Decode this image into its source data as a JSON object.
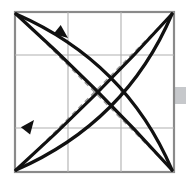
{
  "figure": {
    "canvas": {
      "width": 186,
      "height": 183,
      "background": "#ffffff"
    },
    "frame": {
      "name": "square-paper-border",
      "x": 15,
      "y": 12,
      "width": 159,
      "height": 160,
      "stroke": "#8a8a8a",
      "stroke_width": 2.2,
      "fill": "#ffffff"
    },
    "grid": {
      "name": "thirds-grid",
      "stroke": "#b0b0b0",
      "stroke_width": 1.1,
      "vertical_x": [
        68,
        121
      ],
      "horizontal_y": [
        55,
        128
      ]
    },
    "diagonals": [
      {
        "name": "dashed-diagonal-tl-br",
        "x1": 15,
        "y1": 12,
        "x2": 174,
        "y2": 172,
        "stroke": "#9a9a9a",
        "stroke_width": 1.4,
        "dash": "5 4"
      },
      {
        "name": "dashed-diagonal-bl-tr",
        "x1": 15,
        "y1": 172,
        "x2": 174,
        "y2": 12,
        "stroke": "#9a9a9a",
        "stroke_width": 1.4,
        "dash": "5 4"
      }
    ],
    "curves": [
      {
        "name": "bold-arc-tl-to-br-outer",
        "from": [
          16,
          14
        ],
        "control": [
          96,
          86
        ],
        "to": [
          172,
          170
        ],
        "stroke": "#111111",
        "stroke_width": 3.2
      },
      {
        "name": "bold-arc-tl-to-br-inner",
        "from": [
          16,
          14
        ],
        "control": [
          126,
          62
        ],
        "to": [
          172,
          170
        ],
        "stroke": "#111111",
        "stroke_width": 3.2
      },
      {
        "name": "bold-arc-bl-to-tr-outer",
        "from": [
          16,
          170
        ],
        "control": [
          96,
          98
        ],
        "to": [
          172,
          14
        ],
        "stroke": "#111111",
        "stroke_width": 3.2
      },
      {
        "name": "bold-arc-bl-to-tr-inner",
        "from": [
          16,
          170
        ],
        "control": [
          126,
          122
        ],
        "to": [
          172,
          14
        ],
        "stroke": "#111111",
        "stroke_width": 3.2
      }
    ],
    "arrows": [
      {
        "name": "fold-arrow-up-left",
        "tip": [
          68,
          38
        ],
        "angle_deg": 218,
        "size": 15,
        "fill": "#111111"
      },
      {
        "name": "fold-arrow-down-left",
        "tip": [
          34,
          120
        ],
        "angle_deg": 128,
        "size": 15,
        "fill": "#111111"
      }
    ],
    "edge_tab": {
      "name": "page-edge-tab",
      "x": 172,
      "y": 87,
      "width": 14,
      "height": 17,
      "fill": "#c6c8cb"
    }
  }
}
